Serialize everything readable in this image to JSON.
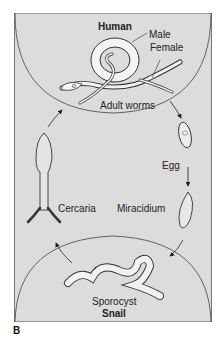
{
  "figure": {
    "panel_label": "B",
    "hosts": {
      "top": "Human",
      "bottom": "Snail"
    },
    "stages": {
      "male": "Male",
      "female": "Female",
      "adult_worms": "Adult worms",
      "egg": "Egg",
      "miracidium": "Miracidium",
      "sporocyst": "Sporocyst",
      "cercaria": "Cercaria"
    },
    "colors": {
      "background": "#dcdcdc",
      "outline": "#444444",
      "worm_fill": "#f2f2f2"
    }
  }
}
